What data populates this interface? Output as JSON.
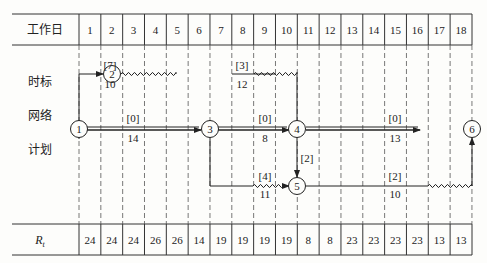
{
  "header": {
    "row_label": "工作日",
    "days": [
      "1",
      "2",
      "3",
      "4",
      "5",
      "6",
      "7",
      "8",
      "9",
      "10",
      "11",
      "12",
      "13",
      "14",
      "15",
      "16",
      "17",
      "18"
    ]
  },
  "side_labels": [
    "时标",
    "网络",
    "计划"
  ],
  "footer": {
    "row_label": "R_t",
    "row_label_main": "R",
    "row_label_sub": "t",
    "values": [
      "24",
      "24",
      "24",
      "26",
      "26",
      "14",
      "19",
      "19",
      "19",
      "19",
      "8",
      "8",
      "23",
      "23",
      "23",
      "23",
      "13",
      "13"
    ]
  },
  "nodes": [
    {
      "id": "1",
      "label": "1",
      "day": 0,
      "row": "mid"
    },
    {
      "id": "2",
      "label": "2",
      "day": 3,
      "row": "top"
    },
    {
      "id": "3",
      "label": "3",
      "day": 6,
      "row": "mid"
    },
    {
      "id": "4",
      "label": "4",
      "day": 12,
      "row": "mid"
    },
    {
      "id": "5",
      "label": "5",
      "day": 12,
      "row": "bottom"
    },
    {
      "id": "6",
      "label": "6",
      "day": 18,
      "row": "mid"
    }
  ],
  "activities": [
    {
      "from": "1",
      "to": "2",
      "float": "[7]",
      "resource": "10",
      "label_day": 2
    },
    {
      "from": "2",
      "to": "4",
      "float": "[3]",
      "resource": "12",
      "label_day": 9
    },
    {
      "from": "1",
      "to": "3",
      "float": "[0]",
      "resource": "14",
      "label_day": 3
    },
    {
      "from": "3",
      "to": "4",
      "float": "[0]",
      "resource": "8",
      "label_day": 9
    },
    {
      "from": "4",
      "to": "6",
      "float": "[0]",
      "resource": "13",
      "label_day": 15
    },
    {
      "from": "4",
      "to": "5",
      "float": "[2]",
      "resource": "",
      "label_day": 12
    },
    {
      "from": "3",
      "to": "5",
      "float": "[4]",
      "resource": "11",
      "label_day": 9
    },
    {
      "from": "5",
      "to": "6",
      "float": "[2]",
      "resource": "10",
      "label_day": 15
    }
  ]
}
